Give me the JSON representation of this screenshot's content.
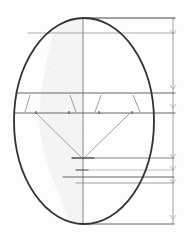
{
  "drawing": {
    "subject": "head proportion sketch",
    "style": "pencil",
    "colors": {
      "paper": "#fdfdfd",
      "outline": "#3a3a3a",
      "guide": "#6a6a6a",
      "light_guide": "#9a9a9a",
      "shading": "#c8c8c8"
    },
    "oval": {
      "cx": 84,
      "cy": 121,
      "rx": 70,
      "ry": 103
    },
    "center_line": {
      "x": 83,
      "y1": 18,
      "y2": 224
    },
    "measure_line": {
      "x": 173,
      "y1": 18,
      "y2": 224
    },
    "horizontal_guides": [
      {
        "y": 18,
        "x1": 83,
        "x2": 175
      },
      {
        "y": 33,
        "x1": 28,
        "x2": 175
      },
      {
        "y": 93,
        "x1": 16,
        "x2": 175
      },
      {
        "y": 113,
        "x1": 15,
        "x2": 175
      },
      {
        "y": 158,
        "x1": 72,
        "x2": 174
      },
      {
        "y": 170,
        "x1": 76,
        "x2": 174
      },
      {
        "y": 177,
        "x1": 63,
        "x2": 174
      },
      {
        "y": 183,
        "x1": 76,
        "x2": 174
      },
      {
        "y": 224,
        "x1": 80,
        "x2": 174
      }
    ],
    "arrow_marks_y": [
      33,
      88,
      108,
      158,
      170,
      183,
      218
    ]
  }
}
